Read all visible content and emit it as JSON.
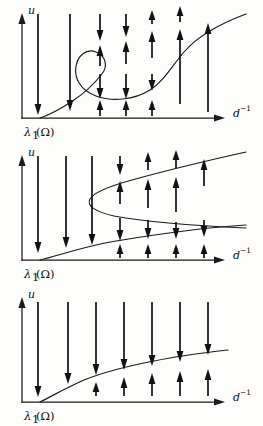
{
  "figure": {
    "type": "bifurcation-diagram-series",
    "panel_count": 3,
    "background_color": "#fdfdfc",
    "ink_color": "#111111",
    "axes": {
      "y_label": "u",
      "x_label_base": "d",
      "x_label_exponent": "−1",
      "origin_label_base": "λ",
      "origin_label_sub": "1",
      "origin_label_arg": "(Ω)"
    },
    "panels": [
      {
        "name": "panel-s-shaped-three-branch",
        "index": 0,
        "description": "S-shaped (sigmoidal) bifurcation curve with two folds producing three coexisting branches over a range of d-inverse",
        "curve_shape": "s-curve",
        "fold_count": 2,
        "bifurcation_point_label": "λ1(Ω)",
        "arrow_columns": 7,
        "arrow_directions": [
          "down",
          "down",
          "down-down",
          "down-up-down",
          "up-up-up",
          "up-up-up",
          "up"
        ]
      },
      {
        "name": "panel-turning-point-detached-fold",
        "index": 1,
        "description": "Monotone lower branch from the bifurcation point plus a detached fold (turning point) opening to the right",
        "curve_shape": "monotone-plus-fold",
        "fold_count": 1,
        "bifurcation_point_label": "λ1(Ω)",
        "arrow_columns": 7,
        "arrow_directions": [
          "down",
          "down",
          "down",
          "down-up-down-up",
          "up-down-up",
          "up-down-up",
          "up-down-up"
        ]
      },
      {
        "name": "panel-monotone-single-branch",
        "index": 2,
        "description": "Single monotone increasing branch emanating from the bifurcation point; no folds",
        "curve_shape": "monotone",
        "fold_count": 0,
        "bifurcation_point_label": "λ1(Ω)",
        "arrow_columns": 7,
        "arrow_directions": [
          "down",
          "down",
          "down-up",
          "down-up",
          "down-up",
          "down-up",
          "down-up"
        ]
      }
    ]
  }
}
